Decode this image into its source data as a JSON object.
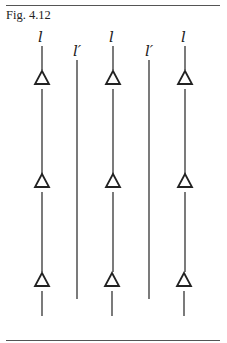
{
  "figure": {
    "caption": "Fig. 4.12",
    "columns": [
      {
        "label": "l",
        "x": 42,
        "type": "with-triangles"
      },
      {
        "label": "l′",
        "x": 77,
        "type": "plain"
      },
      {
        "label": "l",
        "x": 113,
        "type": "with-triangles"
      },
      {
        "label": "l′",
        "x": 149,
        "type": "plain"
      },
      {
        "label": "l",
        "x": 185,
        "type": "with-triangles"
      }
    ],
    "triangle_rows_y": [
      78,
      182,
      283
    ],
    "marker_shape": "open-triangle"
  }
}
